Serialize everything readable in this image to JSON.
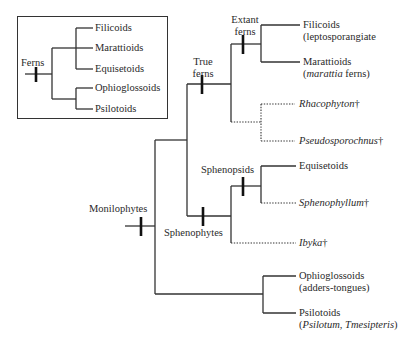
{
  "inset": {
    "root_label": "Ferns",
    "leaves": [
      "Filicoids",
      "Marattioids",
      "Equisetoids",
      "Ophioglossoids",
      "Psilotoids"
    ]
  },
  "tree": {
    "root": {
      "label": "Monilophytes"
    },
    "nodes": {
      "true_ferns": {
        "line1": "True",
        "line2": "ferns"
      },
      "extant_ferns": {
        "line1": "Extant",
        "line2": "ferns"
      },
      "sphenophytes": {
        "label": "Sphenophytes"
      },
      "sphenopsids": {
        "label": "Sphenopsids"
      }
    },
    "leaves": {
      "filicoids": {
        "name": "Filicoids",
        "sub": "(leptosporangiate"
      },
      "marattioids": {
        "name": "Marattioids",
        "sub_open": "(",
        "sub_italic": "marattia",
        "sub_rest": " ferns)"
      },
      "rhacophyton": {
        "name": "Rhacophyton",
        "mark": "†"
      },
      "pseudosporochnus": {
        "name": "Pseudosporochnus",
        "mark": "†"
      },
      "equisetoids": {
        "name": "Equisetoids"
      },
      "sphenophyllum": {
        "name": "Sphenophyllum",
        "mark": "†"
      },
      "ibyka": {
        "name": "Ibyka",
        "mark": "†"
      },
      "ophioglossoids": {
        "name": "Ophioglossoids",
        "sub": "(adders-tongues)"
      },
      "psilotoids": {
        "name": "Psilotoids",
        "sub_open": "(",
        "sub_italic": "Psilotum, Tmesipteris",
        "sub_close": ")"
      }
    },
    "legend": {
      "solid_line": "extant lineage",
      "dotted_line": "extinct lineage",
      "dagger": "†"
    }
  },
  "colors": {
    "line": "#333333",
    "text": "#2a2a2a",
    "background": "#ffffff"
  }
}
